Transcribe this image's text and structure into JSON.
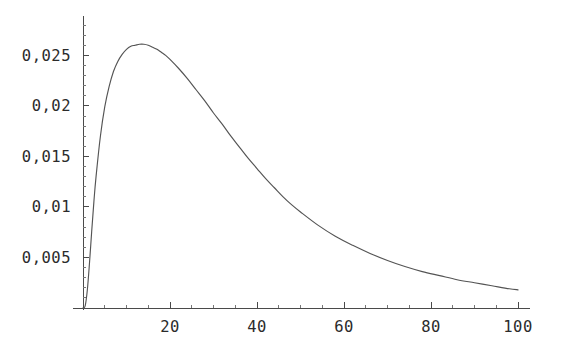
{
  "chart_data": {
    "type": "line",
    "title": "",
    "subtitle": "",
    "xlabel": "",
    "ylabel": "",
    "xlim": [
      0,
      100
    ],
    "ylim": [
      0,
      0.0285
    ],
    "grid": false,
    "legend": null,
    "decimal_separator": ",",
    "axis_style": "mathematica",
    "colors": {
      "curve": "#545454",
      "axis": "#4a4a4a",
      "background": "#ffffff",
      "label": "#2b2b2b"
    },
    "x_ticks_major": [
      20,
      40,
      60,
      80,
      100
    ],
    "x_tick_labels": [
      "20",
      "40",
      "60",
      "80",
      "100"
    ],
    "x_ticks_minor": [
      5,
      10,
      15,
      25,
      30,
      35,
      45,
      50,
      55,
      65,
      70,
      75,
      85,
      90,
      95
    ],
    "y_ticks_major": [
      0.005,
      0.01,
      0.015,
      0.02,
      0.025
    ],
    "y_tick_labels": [
      "0,005",
      "0,01",
      "0,015",
      "0,02",
      "0,025"
    ],
    "y_ticks_minor": [
      0.001,
      0.002,
      0.003,
      0.004,
      0.006,
      0.007,
      0.008,
      0.009,
      0.011,
      0.012,
      0.013,
      0.014,
      0.016,
      0.017,
      0.018,
      0.019,
      0.021,
      0.022,
      0.023,
      0.024,
      0.026,
      0.027,
      0.028
    ],
    "series": [
      {
        "name": "density",
        "x": [
          0,
          0.5,
          1,
          1.5,
          2,
          2.5,
          3,
          4,
          5,
          6,
          7,
          8,
          9,
          10,
          11,
          12,
          13,
          14,
          15,
          16,
          17,
          18,
          19,
          20,
          22,
          24,
          26,
          28,
          30,
          32,
          34,
          36,
          38,
          40,
          42,
          44,
          46,
          48,
          50,
          54,
          58,
          62,
          66,
          70,
          74,
          78,
          82,
          86,
          90,
          94,
          98,
          100
        ],
        "y": [
          0.0,
          0.0002,
          0.0018,
          0.0045,
          0.0076,
          0.0105,
          0.013,
          0.017,
          0.0199,
          0.0219,
          0.0234,
          0.0244,
          0.0251,
          0.0256,
          0.0259,
          0.026,
          0.0261,
          0.0261,
          0.026,
          0.0258,
          0.0256,
          0.0253,
          0.025,
          0.0246,
          0.0237,
          0.0227,
          0.0216,
          0.0205,
          0.0193,
          0.0182,
          0.017,
          0.0159,
          0.0148,
          0.0138,
          0.0128,
          0.0119,
          0.011,
          0.0102,
          0.0095,
          0.0082,
          0.0071,
          0.0062,
          0.0054,
          0.0047,
          0.0041,
          0.0036,
          0.0032,
          0.0028,
          0.0025,
          0.0022,
          0.0019,
          0.0018
        ],
        "peak_x": 14,
        "peak_y": 0.0261,
        "end_y": 0.0018
      }
    ],
    "geometry": {
      "origin_px": [
        83,
        308
      ],
      "x_end_px": 518,
      "y_top_px": 20,
      "px_per_x_unit": 4.35,
      "px_per_y_unit": 10750
    }
  }
}
